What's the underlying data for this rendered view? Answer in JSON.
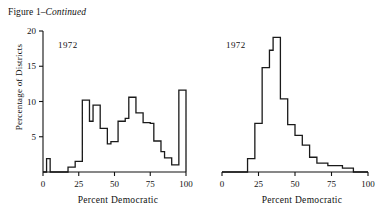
{
  "figure": {
    "title_prefix": "Figure 1–",
    "title_emphasis": "Continued"
  },
  "chart_data": [
    {
      "type": "bar",
      "panel": "left",
      "title": "1972",
      "annotation": "1972",
      "xlabel": "Percent Democratic",
      "ylabel": "Percentage of Districts",
      "xlim": [
        0,
        100
      ],
      "ylim": [
        0,
        20
      ],
      "xticks": [
        0,
        25,
        50,
        75,
        100
      ],
      "xtick_labels": [
        "0",
        "25",
        "50",
        "75",
        "100"
      ],
      "yticks": [
        0,
        5,
        10,
        15,
        20
      ],
      "ytick_labels": [
        "0",
        "5",
        "10",
        "15",
        "20"
      ],
      "grid": false,
      "legend": "none",
      "yaxis_visible": true,
      "bin_width": 2.5,
      "bin_edges": [
        0,
        2.5,
        5,
        7.5,
        10,
        12.5,
        15,
        17.5,
        20,
        22.5,
        25,
        27.5,
        30,
        32.5,
        35,
        37.5,
        40,
        42.5,
        45,
        47.5,
        50,
        52.5,
        55,
        57.5,
        60,
        62.5,
        65,
        67.5,
        70,
        72.5,
        75,
        77.5,
        80,
        82.5,
        85,
        87.5,
        90,
        92.5,
        95,
        97.5,
        100
      ],
      "values": [
        0,
        1.9,
        0,
        0,
        0,
        0,
        0,
        0.7,
        0.7,
        1.5,
        1.5,
        10.2,
        10.2,
        7.2,
        9.5,
        9.5,
        6.2,
        6.2,
        4.0,
        4.3,
        4.3,
        7.2,
        7.2,
        7.6,
        10.6,
        10.6,
        8.4,
        8.4,
        7.0,
        7.0,
        6.9,
        4.4,
        4.4,
        2.9,
        2.0,
        2.0,
        1.0,
        1.0,
        11.6,
        11.6
      ]
    },
    {
      "type": "bar",
      "panel": "right",
      "title": "1972",
      "annotation": "1972",
      "xlabel": "Percent Democratic",
      "ylabel": "",
      "xlim": [
        0,
        100
      ],
      "ylim": [
        0,
        22
      ],
      "xticks": [
        0,
        25,
        50,
        75,
        100
      ],
      "xtick_labels": [
        "0",
        "25",
        "50",
        "75",
        "100"
      ],
      "yticks": [],
      "ytick_labels": [],
      "grid": false,
      "legend": "none",
      "yaxis_visible": false,
      "bin_width": 2.5,
      "bin_edges": [
        0,
        2.5,
        5,
        7.5,
        10,
        12.5,
        15,
        17.5,
        20,
        22.5,
        25,
        27.5,
        30,
        32.5,
        35,
        37.5,
        40,
        42.5,
        45,
        47.5,
        50,
        52.5,
        55,
        57.5,
        60,
        62.5,
        65,
        67.5,
        70,
        72.5,
        75,
        77.5,
        80,
        82.5,
        85,
        87.5,
        90,
        92.5,
        95,
        97.5,
        100
      ],
      "values": [
        0,
        0,
        0,
        0,
        0,
        0,
        0,
        2.1,
        2.1,
        7.6,
        7.6,
        16.3,
        16.3,
        19.0,
        21.0,
        21.0,
        11.4,
        11.4,
        7.4,
        7.4,
        5.7,
        5.7,
        4.2,
        4.2,
        2.3,
        2.3,
        1.4,
        1.4,
        1.4,
        1.0,
        1.0,
        1.0,
        1.0,
        0.6,
        0.6,
        0.6,
        0,
        0,
        0,
        0
      ]
    }
  ]
}
